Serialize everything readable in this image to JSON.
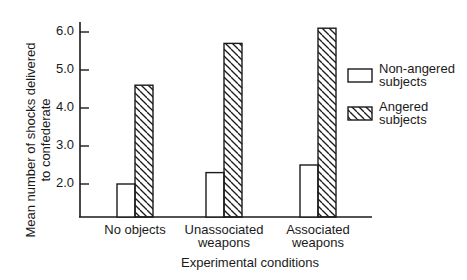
{
  "chart_data": {
    "type": "bar",
    "title": "",
    "xlabel": "Experimental conditions",
    "ylabel": "Mean number of shocks delivered to confederate",
    "ylabel_lines": [
      "Mean number of shocks delivered",
      "to confederate"
    ],
    "categories": [
      "No objects",
      "Unassociated weapons",
      "Associated weapons"
    ],
    "category_lines": [
      [
        "No objects"
      ],
      [
        "Unassociated",
        "weapons"
      ],
      [
        "Associated",
        "weapons"
      ]
    ],
    "series": [
      {
        "name": "Non-angered subjects",
        "pattern": "open",
        "values": [
          2.0,
          2.3,
          2.5
        ]
      },
      {
        "name": "Angered subjects",
        "pattern": "hatched",
        "values": [
          4.6,
          5.7,
          6.1
        ]
      }
    ],
    "yticks": [
      "2.0",
      "3.0",
      "4.0",
      "5.0",
      "6.0"
    ],
    "ytick_values": [
      2.0,
      3.0,
      4.0,
      5.0,
      6.0
    ],
    "ylim": [
      1.0,
      6.3
    ],
    "grid": false,
    "legend_position": "right",
    "legend": [
      {
        "lines": [
          "Non-angered",
          "subjects"
        ],
        "pattern": "open"
      },
      {
        "lines": [
          "Angered",
          "subjects"
        ],
        "pattern": "hatched"
      }
    ]
  }
}
